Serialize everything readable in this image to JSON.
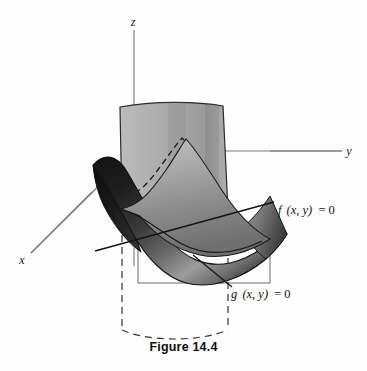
{
  "figure": {
    "caption": "Figure 14.4",
    "background_color": "#fdfdfd",
    "axes": {
      "z_label": "z",
      "y_label": "y",
      "x_label": "x",
      "axis_color": "#7a7a7a"
    },
    "annotations": [
      {
        "name": "f-surface-label",
        "text_plain": "f (x, y) = 0",
        "fn": "f",
        "args": "(x, y)",
        "relation": "= 0",
        "x": 278,
        "y": 214
      },
      {
        "name": "g-surface-label",
        "text_plain": "g (x, y) = 0",
        "fn": "g",
        "args": "(x, y)",
        "relation": "= 0",
        "x": 231,
        "y": 294
      }
    ],
    "surfaces": [
      {
        "name": "vertical-cylinder-f",
        "label": "f (x, y) = 0",
        "fill_top": "#b6b6b6",
        "fill_bottom": "#9d9d9d",
        "edge_color": "#2b2b2b",
        "description": "vertical cylindrical sheet over the curve f(x,y)=0"
      },
      {
        "name": "saddle-surface-g",
        "label": "g (x, y) = 0",
        "fill_light": "#b0b0b0",
        "fill_dark": "#222222",
        "edge_color": "#111111",
        "description": "dark curved saddle / bowl surface"
      },
      {
        "name": "xy-plane-frame",
        "edge_color": "#5c5c5c",
        "description": "thin parallelogram outline of the xy-plane region"
      },
      {
        "name": "projection-curve",
        "style": "dashed",
        "edge_color": "#3a3a3a",
        "description": "dashed projection of cylinder base onto xy-plane"
      }
    ],
    "colors": {
      "paper": "#fdfdfd",
      "ink": "#111111",
      "light_gray": "#b6b6b6",
      "mid_gray": "#8f8f8f",
      "dark_gray": "#2a2a2a",
      "axis_gray": "#7a7a7a"
    }
  }
}
